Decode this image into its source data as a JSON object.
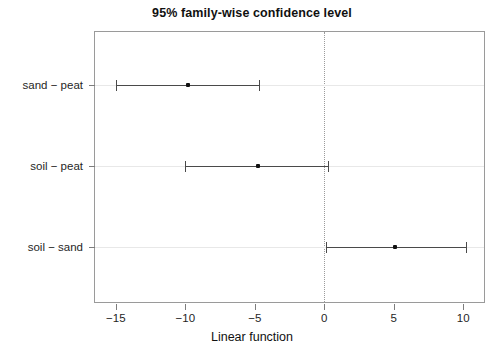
{
  "chart_data": {
    "type": "scatter",
    "title": "95% family-wise confidence level",
    "xlabel": "Linear function",
    "ylabel": "",
    "xlim": [
      -16.5,
      11.5
    ],
    "ylim": [
      0,
      3
    ],
    "grid": false,
    "legend": "none",
    "reference_line": 0,
    "xticks": [
      -15,
      -10,
      -5,
      0,
      5,
      10
    ],
    "xticklabels": [
      "−15",
      "−10",
      "−5",
      "0",
      "5",
      "10"
    ],
    "categories": [
      "sand − peat",
      "soil − peat",
      "soil − sand"
    ],
    "series": [
      {
        "name": "estimate",
        "values": [
          -9.8,
          -4.8,
          5.1
        ]
      },
      {
        "name": "lower",
        "values": [
          -15.0,
          -10.0,
          0.1
        ]
      },
      {
        "name": "upper",
        "values": [
          -4.7,
          0.3,
          10.2
        ]
      }
    ],
    "points": [
      {
        "label": "sand − peat",
        "estimate": -9.8,
        "lower": -15.0,
        "upper": -4.7
      },
      {
        "label": "soil − peat",
        "estimate": -4.8,
        "lower": -10.0,
        "upper": 0.3
      },
      {
        "label": "soil − sand",
        "estimate": 5.1,
        "lower": 0.1,
        "upper": 10.2
      }
    ],
    "colors": {
      "line": "#4a4a4a",
      "point": "#111111",
      "panel_border": "#9a9a9a",
      "zero_line": "#9b9b9b",
      "row_guide": "#e8e8e8",
      "text": "#1f1f1f",
      "background": "#ffffff"
    }
  }
}
